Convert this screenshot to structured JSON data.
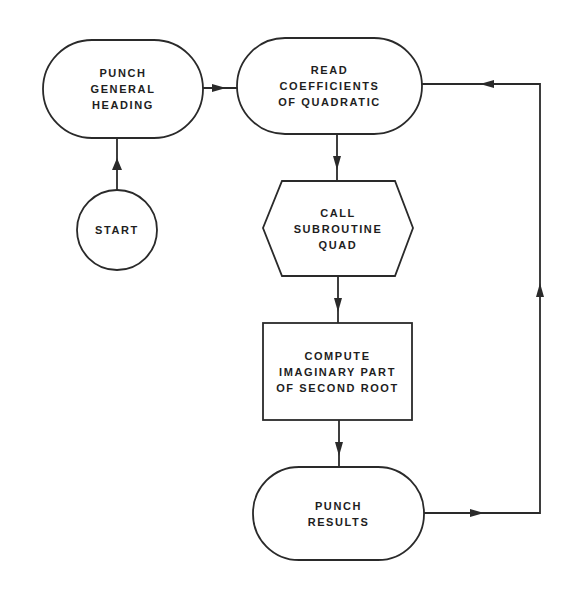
{
  "diagram": {
    "type": "flowchart",
    "colors": {
      "stroke": "#2a2a2a",
      "text": "#1e1e1e",
      "background": "#ffffff"
    },
    "nodes": {
      "punch_heading": {
        "shape": "terminal",
        "lines": [
          "PUNCH",
          "GENERAL",
          "HEADING"
        ]
      },
      "read_coefficients": {
        "shape": "terminal",
        "lines": [
          "READ",
          "COEFFICIENTS",
          "OF QUADRATIC"
        ]
      },
      "start": {
        "shape": "connector-circle",
        "lines": [
          "START"
        ]
      },
      "call_quad": {
        "shape": "hexagon-preparation",
        "lines": [
          "CALL",
          "SUBROUTINE",
          "QUAD"
        ]
      },
      "compute_imaginary": {
        "shape": "process-rectangle",
        "lines": [
          "COMPUTE",
          "IMAGINARY PART",
          "OF SECOND ROOT"
        ]
      },
      "punch_results": {
        "shape": "terminal",
        "lines": [
          "PUNCH",
          "RESULTS"
        ]
      }
    },
    "edges": [
      {
        "from": "start",
        "to": "punch_heading"
      },
      {
        "from": "punch_heading",
        "to": "read_coefficients"
      },
      {
        "from": "read_coefficients",
        "to": "call_quad"
      },
      {
        "from": "call_quad",
        "to": "compute_imaginary"
      },
      {
        "from": "compute_imaginary",
        "to": "punch_results"
      },
      {
        "from": "punch_results",
        "to": "read_coefficients",
        "note": "loop back via right side"
      }
    ]
  }
}
